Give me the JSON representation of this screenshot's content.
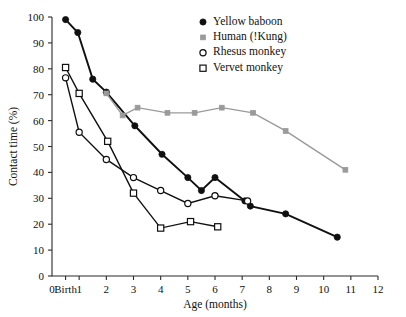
{
  "chart_data": {
    "type": "line",
    "title": "",
    "xlabel": "Age (months)",
    "ylabel": "Contact time (%)",
    "xlim": [
      0,
      12
    ],
    "ylim": [
      0,
      100
    ],
    "grid": false,
    "legend_position": "top-right",
    "x_tick_labels": [
      "0",
      "Birth",
      "1",
      "2",
      "3",
      "4",
      "5",
      "6",
      "7",
      "8",
      "9",
      "10",
      "11",
      "12"
    ],
    "x_tick_values": [
      0,
      0.5,
      1,
      2,
      3,
      4,
      5,
      6,
      7,
      8,
      9,
      10,
      11,
      12
    ],
    "y_tick_labels": [
      "0",
      "10",
      "20",
      "30",
      "40",
      "50",
      "60",
      "70",
      "80",
      "90",
      "100"
    ],
    "y_tick_values": [
      0,
      10,
      20,
      30,
      40,
      50,
      60,
      70,
      80,
      90,
      100
    ],
    "series": [
      {
        "name": "Yellow baboon",
        "marker": "filled-circle",
        "color": "#101010",
        "x": [
          0.5,
          0.95,
          1.5,
          2.0,
          3.05,
          4.05,
          5.0,
          5.5,
          6.0,
          7.1,
          7.3,
          8.6,
          10.5
        ],
        "values": [
          99,
          94,
          76,
          71,
          58,
          47,
          38,
          33,
          38,
          29,
          27,
          24,
          15
        ]
      },
      {
        "name": "Human (!Kung)",
        "marker": "filled-square",
        "color": "#9a9a9a",
        "x": [
          2.0,
          2.6,
          3.15,
          4.25,
          5.25,
          6.25,
          7.4,
          8.6,
          10.8
        ],
        "values": [
          70.5,
          62,
          65,
          63,
          63,
          65,
          63,
          56,
          41
        ]
      },
      {
        "name": "Rhesus monkey",
        "marker": "open-circle",
        "color": "#101010",
        "x": [
          0.5,
          1.0,
          2.0,
          3.0,
          4.0,
          5.0,
          6.0,
          7.2
        ],
        "values": [
          76.5,
          55.5,
          45,
          38,
          33,
          28,
          31,
          29
        ]
      },
      {
        "name": "Vervet monkey",
        "marker": "open-square",
        "color": "#101010",
        "x": [
          0.5,
          1.0,
          2.05,
          3.0,
          4.0,
          5.1,
          6.1
        ],
        "values": [
          80.5,
          70.5,
          52,
          32,
          18.5,
          21,
          19
        ]
      }
    ]
  }
}
